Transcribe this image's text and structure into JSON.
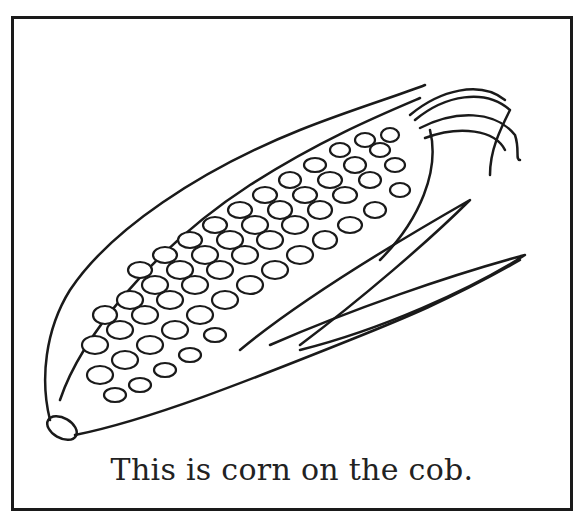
{
  "illustration": {
    "subject": "corn-on-the-cob",
    "style": "black line art coloring page",
    "caption": "This is corn on the cob."
  },
  "colors": {
    "line": "#1a1a1a",
    "background": "#ffffff"
  }
}
